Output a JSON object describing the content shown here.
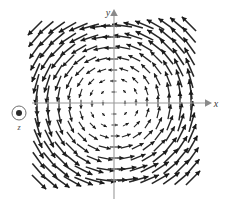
{
  "figure": {
    "kind": "vector-field-quiver-plot",
    "background_color": "#ffffff",
    "axis_color": "#9a9a9a",
    "arrow_color": "#262626",
    "width": 229,
    "height": 206
  },
  "axes": {
    "x_label": "x",
    "y_label": "y",
    "origin_px": [
      114,
      103
    ],
    "x_axis_y_px": 103,
    "y_axis_x_px": 114,
    "x_axis_extent_px": [
      32,
      207
    ],
    "y_axis_extent_px": [
      14,
      199
    ],
    "tick_spacing_px": 11,
    "tick_length_px": 3,
    "x_tick_count_each_side": 7,
    "y_tick_count_each_side": 7,
    "grid": false,
    "tick_labels": []
  },
  "z_axis_marker": {
    "label": "z",
    "glyph": "circle-with-dot",
    "meaning": "out-of-page",
    "center_px": [
      19,
      113
    ],
    "outer_radius_px": 7,
    "inner_radius_px": 3
  },
  "chart_data": {
    "type": "quiver",
    "title": "",
    "xlabel": "x",
    "ylabel": "y",
    "field_formula": "F = ẑ × r = (-y, x)",
    "rotation_sense": "counterclockwise",
    "magnitude_growth": "proportional to distance from origin",
    "xlim": [
      -7,
      7
    ],
    "ylim": [
      -7,
      7
    ],
    "sample_step": 1,
    "grid_columns": 15,
    "grid_rows": 15,
    "max_arrow_length_px": 13,
    "legend": [],
    "annotations": [
      {
        "text": "z",
        "type": "axis-out-of-page-marker"
      },
      {
        "text": "x",
        "type": "axis-label"
      },
      {
        "text": "y",
        "type": "axis-label"
      }
    ]
  }
}
